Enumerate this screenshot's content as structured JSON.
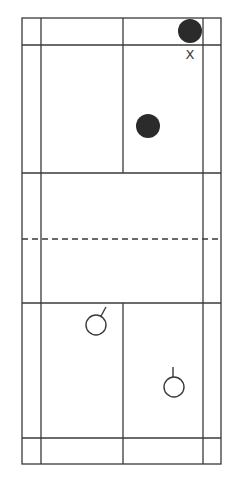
{
  "diagram": {
    "type": "badminton-court",
    "orientation": "vertical",
    "colors": {
      "background": "#ffffff",
      "line": "#3a3a3a",
      "filled_player": "#2b2b2b",
      "open_player_stroke": "#3a3a3a"
    },
    "court": {
      "outer": {
        "left": 22,
        "right": 221,
        "top": 18,
        "bottom": 464
      },
      "singles_sidelines": {
        "left": 41,
        "right": 203
      },
      "center_line_x": 123,
      "top_long_service_line_y": 45,
      "top_short_service_line_y": 173,
      "net_y": 239,
      "bottom_short_service_line_y": 303,
      "bottom_long_service_line_y": 438
    },
    "players": [
      {
        "id": "top-back",
        "style": "filled",
        "cx": 190,
        "cy": 31,
        "r": 12
      },
      {
        "id": "top-mid",
        "style": "filled",
        "cx": 148,
        "cy": 126,
        "r": 12
      },
      {
        "id": "bottom-left",
        "style": "open",
        "cx": 96,
        "cy": 325,
        "r": 10,
        "stem": {
          "x1": 101,
          "y1": 316,
          "x2": 106,
          "y2": 307
        }
      },
      {
        "id": "bottom-right",
        "style": "open",
        "cx": 174,
        "cy": 387,
        "r": 10,
        "stem": {
          "x1": 173,
          "y1": 377,
          "x2": 173,
          "y2": 367
        }
      }
    ],
    "markers": [
      {
        "id": "x-mark",
        "label": "X",
        "x": 190,
        "y": 55
      }
    ]
  }
}
